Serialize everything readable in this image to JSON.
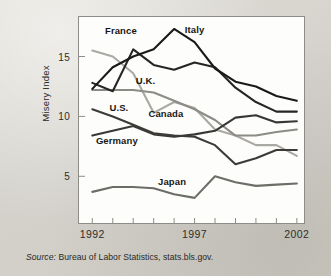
{
  "figure": {
    "source_lead": "Source:",
    "source_text": " Bureau of Labor Statistics, stats.bls.gov."
  },
  "chart_data": {
    "type": "line",
    "title": "",
    "subtitle": "",
    "xlabel": "",
    "ylabel": "Misery Index",
    "xlim": [
      1991.35,
      2002.35
    ],
    "ylim": [
      1.1,
      18.3
    ],
    "grid": false,
    "legend": "inline-labels",
    "yticks": [
      5,
      10,
      15
    ],
    "ytick_labels": [
      "5",
      "10",
      "15"
    ],
    "xticks": [
      1992,
      1997,
      2002
    ],
    "xtick_labels": [
      "1992",
      "1997",
      "2002"
    ],
    "x": [
      1992,
      1993,
      1994,
      1995,
      1996,
      1997,
      1998,
      1999,
      2000,
      2001,
      2002
    ],
    "series": [
      {
        "name": "Italy",
        "color": "#1a1a1a",
        "label_x": 1997.0,
        "label_y": 17.3,
        "values": [
          12.3,
          14.1,
          15.0,
          15.6,
          17.3,
          16.2,
          14.0,
          12.9,
          12.5,
          11.7,
          11.3
        ]
      },
      {
        "name": "France",
        "color": "#262626",
        "label_x": 1993.4,
        "label_y": 17.2,
        "values": [
          12.8,
          12.1,
          15.6,
          14.3,
          13.9,
          14.5,
          14.1,
          12.4,
          11.2,
          10.4,
          10.4
        ]
      },
      {
        "name": "U.K.",
        "color": "#aaa8a3",
        "label_x": 1994.6,
        "label_y": 13.0,
        "values": [
          15.5,
          15.0,
          13.6,
          10.3,
          11.2,
          10.7,
          8.9,
          8.4,
          7.6,
          7.6,
          6.7
        ]
      },
      {
        "name": "Canada",
        "color": "#8d8b86",
        "label_x": 1995.6,
        "label_y": 10.3,
        "values": [
          12.2,
          12.2,
          12.2,
          12.0,
          11.3,
          10.6,
          9.7,
          8.4,
          8.4,
          8.7,
          8.9
        ]
      },
      {
        "name": "U.S.",
        "color": "#3d3b38",
        "label_x": 1993.3,
        "label_y": 10.8,
        "values": [
          10.6,
          10.0,
          9.3,
          8.6,
          8.4,
          8.3,
          7.6,
          6.0,
          6.5,
          7.2,
          7.2
        ]
      },
      {
        "name": "Germany",
        "color": "#3a3835",
        "label_x": 1993.2,
        "label_y": 8.0,
        "values": [
          8.4,
          8.8,
          9.2,
          8.5,
          8.3,
          8.5,
          8.8,
          9.9,
          10.1,
          9.5,
          9.6
        ]
      },
      {
        "name": "Japan",
        "color": "#6e6c67",
        "label_x": 1995.9,
        "label_y": 4.6,
        "values": [
          3.7,
          4.1,
          4.1,
          4.0,
          3.5,
          3.2,
          5.0,
          4.5,
          4.2,
          4.3,
          4.4
        ]
      }
    ]
  }
}
